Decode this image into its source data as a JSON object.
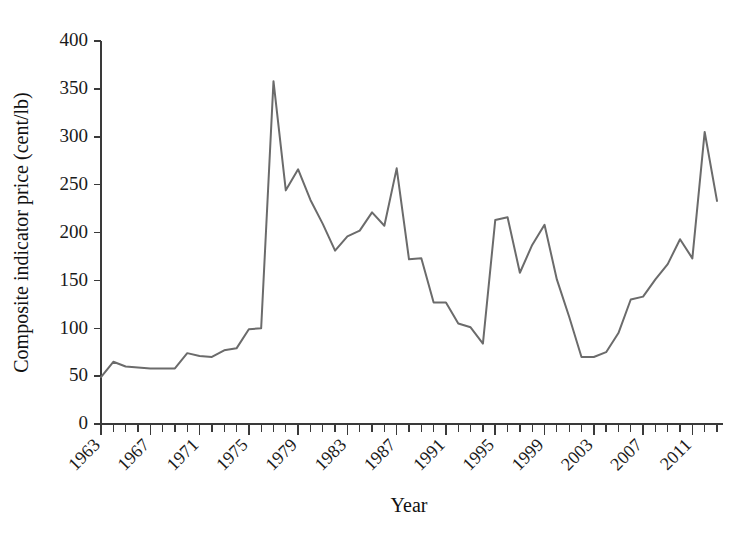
{
  "chart_data": {
    "type": "line",
    "title": "",
    "xlabel": "Year",
    "ylabel": "Composite indicator price (cent/lb)",
    "xlim": [
      1963,
      2013
    ],
    "ylim": [
      0,
      400
    ],
    "grid": false,
    "legend": false,
    "line_color": "#6b6b6b",
    "axis_color": "#3a3a3a",
    "x_tick_labels": [
      "1963",
      "1967",
      "1971",
      "1975",
      "1979",
      "1983",
      "1987",
      "1991",
      "1995",
      "1999",
      "2003",
      "2007",
      "2011"
    ],
    "x_tick_values": [
      1963,
      1967,
      1971,
      1975,
      1979,
      1983,
      1987,
      1991,
      1995,
      1999,
      2003,
      2007,
      2011
    ],
    "x_minor_step": 1,
    "y_tick_labels": [
      "0",
      "50",
      "100",
      "150",
      "200",
      "250",
      "300",
      "350",
      "400"
    ],
    "y_tick_values": [
      0,
      50,
      100,
      150,
      200,
      250,
      300,
      350,
      400
    ],
    "x": [
      1963,
      1964,
      1965,
      1966,
      1967,
      1968,
      1969,
      1970,
      1971,
      1972,
      1973,
      1974,
      1975,
      1976,
      1977,
      1978,
      1979,
      1980,
      1981,
      1982,
      1983,
      1984,
      1985,
      1986,
      1987,
      1988,
      1989,
      1990,
      1991,
      1992,
      1993,
      1994,
      1995,
      1996,
      1997,
      1998,
      1999,
      2000,
      2001,
      2002,
      2003,
      2004,
      2005,
      2006,
      2007,
      2008,
      2009,
      2010,
      2011,
      2012,
      2013
    ],
    "values": [
      49,
      65,
      60,
      59,
      58,
      58,
      58,
      74,
      71,
      70,
      77,
      79,
      99,
      100,
      358,
      244,
      266,
      234,
      209,
      181,
      196,
      202,
      221,
      207,
      267,
      172,
      173,
      127,
      127,
      105,
      101,
      84,
      213,
      216,
      158,
      187,
      208,
      151,
      112,
      70,
      70,
      75,
      95,
      130,
      133,
      151,
      167,
      193,
      173,
      305,
      233
    ],
    "annotations": []
  },
  "figure": {
    "width": 746,
    "height": 536,
    "background": "#ffffff"
  }
}
